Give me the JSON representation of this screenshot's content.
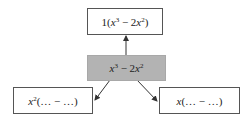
{
  "diagram": {
    "type": "factoring-tree",
    "colors": {
      "center_fill": "#b3b3b3",
      "box_fill": "#ffffff",
      "border": "#555555",
      "arrow": "#333333"
    },
    "center": {
      "label": "x^3 − 2x^2",
      "parts": {
        "v1": "x",
        "p1": "3",
        "op": " − 2",
        "v2": "x",
        "p2": "2"
      }
    },
    "top": {
      "label": "1(x^3 − 2x^2)",
      "parts": {
        "pre": "1(",
        "v1": "x",
        "p1": "3",
        "op": " − 2",
        "v2": "x",
        "p2": "2",
        "post": ")"
      }
    },
    "bottom_left": {
      "label": "x^2(… − …)",
      "parts": {
        "v1": "x",
        "p1": "2",
        "rest": "(… − …)"
      }
    },
    "bottom_right": {
      "label": "x(… − …)",
      "parts": {
        "v1": "x",
        "rest": "(… − …)"
      }
    },
    "edges": [
      {
        "from": "center",
        "to": "top"
      },
      {
        "from": "center",
        "to": "bottom_left"
      },
      {
        "from": "center",
        "to": "bottom_right"
      }
    ]
  }
}
